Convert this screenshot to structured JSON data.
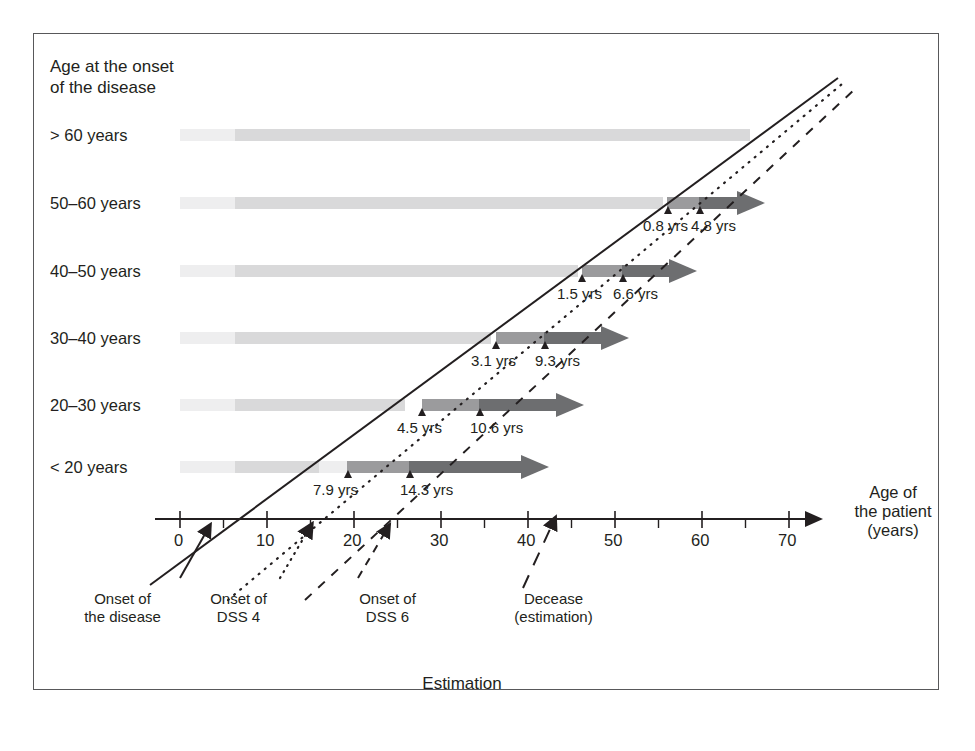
{
  "figure": {
    "caption": "Estimation",
    "axis_header": "Age at the onset\nof the disease",
    "axis_header_line1": "Age at the onset",
    "axis_header_line2": "of the disease",
    "xaxis_title_line1": "Age of",
    "xaxis_title_line2": "the patient",
    "xaxis_title_line3": "(years)"
  },
  "legend": [
    {
      "id": "onset-disease",
      "line1": "Onset of",
      "line2": "the disease",
      "style": "solid",
      "x_year": 5.2
    },
    {
      "id": "onset-dss4",
      "line1": "Onset of",
      "line2": "DSS 4",
      "style": "dotted",
      "x_year": 14.0
    },
    {
      "id": "onset-dss6",
      "line1": "Onset of",
      "line2": "DSS 6",
      "style": "dashed",
      "x_year": 24.0
    },
    {
      "id": "decease",
      "line1": "Decease",
      "line2": "(estimation)",
      "style": "longdash",
      "x_year": 43.0
    }
  ],
  "colors": {
    "light_bar": "#d9d9da",
    "mid_bar": "#9b9b9d",
    "dark_bar": "#6d6e70",
    "axis": "#231f20",
    "frame": "#58585a",
    "text": "#231f20"
  },
  "chart_data": {
    "type": "bar",
    "title": "Estimation",
    "xlabel": "Age of the patient (years)",
    "ylabel": "Age at the onset of the disease",
    "xlim": [
      0,
      73
    ],
    "ylim": [
      0,
      6
    ],
    "grid": false,
    "legend_position": "below-axis",
    "xticks_major": [
      0,
      10,
      20,
      30,
      40,
      50,
      60,
      70
    ],
    "xticks_minor": [
      5,
      15,
      25,
      35,
      45,
      55,
      65
    ],
    "categories": [
      "> 60 years",
      "50–60 years",
      "40–50 years",
      "30–40 years",
      "20–30 years",
      "< 20 years"
    ],
    "series": [
      {
        "category": "> 60 years",
        "light_start": 0,
        "light_end": 65.5,
        "dss4_marker": null,
        "dss6_marker": null,
        "dss4_label": null,
        "dss6_label": null,
        "has_arrow": false
      },
      {
        "category": "50–60 years",
        "light_start": 0,
        "light_end": 55.0,
        "dss4_marker": 55.8,
        "dss6_marker": 60.6,
        "dss4_label": "0.8 yrs",
        "dss6_label": "4.8 yrs",
        "mid_start": 55.0,
        "mid_end": 58.0,
        "dark_start": 58.0,
        "dark_end": 64.0,
        "has_arrow": true
      },
      {
        "category": "40–50 years",
        "light_start": 0,
        "light_end": 45.0,
        "dss4_marker": 46.5,
        "dss6_marker": 51.6,
        "dss4_label": "1.5 yrs",
        "dss6_label": "6.6 yrs",
        "mid_start": 45.0,
        "mid_end": 49.0,
        "dark_start": 49.0,
        "dark_end": 56.0,
        "has_arrow": true
      },
      {
        "category": "30–40 years",
        "light_start": 0,
        "light_end": 35.0,
        "dss4_marker": 38.1,
        "dss6_marker": 44.3,
        "dss4_label": "3.1 yrs",
        "dss6_label": "9.3 yrs",
        "mid_start": 35.0,
        "mid_end": 40.0,
        "dark_start": 40.0,
        "dark_end": 48.0,
        "has_arrow": true
      },
      {
        "category": "20–30 years",
        "light_start": 0,
        "light_end": 25.0,
        "dss4_marker": 29.5,
        "dss6_marker": 35.6,
        "dss4_label": "4.5 yrs",
        "dss6_label": "10.6 yrs",
        "mid_start": 25.0,
        "mid_end": 31.5,
        "dark_start": 31.5,
        "dark_end": 41.0,
        "has_arrow": true
      },
      {
        "category": "< 20 years",
        "light_start": 0,
        "light_end": 15.0,
        "dss4_marker": 22.9,
        "dss6_marker": 29.3,
        "dss4_label": "7.9 yrs",
        "dss6_label": "14.3 yrs",
        "mid_start": 18.5,
        "mid_end": 25.0,
        "dark_start": 25.0,
        "dark_end": 42.0,
        "has_arrow": true
      }
    ],
    "annotations": [
      {
        "text": "0.8 yrs",
        "row": "50–60 years",
        "kind": "dss4"
      },
      {
        "text": "4.8 yrs",
        "row": "50–60 years",
        "kind": "dss6"
      },
      {
        "text": "1.5 yrs",
        "row": "40–50 years",
        "kind": "dss4"
      },
      {
        "text": "6.6 yrs",
        "row": "40–50 years",
        "kind": "dss6"
      },
      {
        "text": "3.1 yrs",
        "row": "30–40 years",
        "kind": "dss4"
      },
      {
        "text": "9.3 yrs",
        "row": "30–40 years",
        "kind": "dss6"
      },
      {
        "text": "4.5 yrs",
        "row": "20–30 years",
        "kind": "dss4"
      },
      {
        "text": "10.6 yrs",
        "row": "20–30 years",
        "kind": "dss6"
      },
      {
        "text": "7.9 yrs",
        "row": "< 20 years",
        "kind": "dss4"
      },
      {
        "text": "14.3 yrs",
        "row": "< 20 years",
        "kind": "dss6"
      }
    ]
  },
  "ticks": {
    "labels": [
      "0",
      "10",
      "20",
      "30",
      "40",
      "50",
      "60",
      "70"
    ]
  }
}
